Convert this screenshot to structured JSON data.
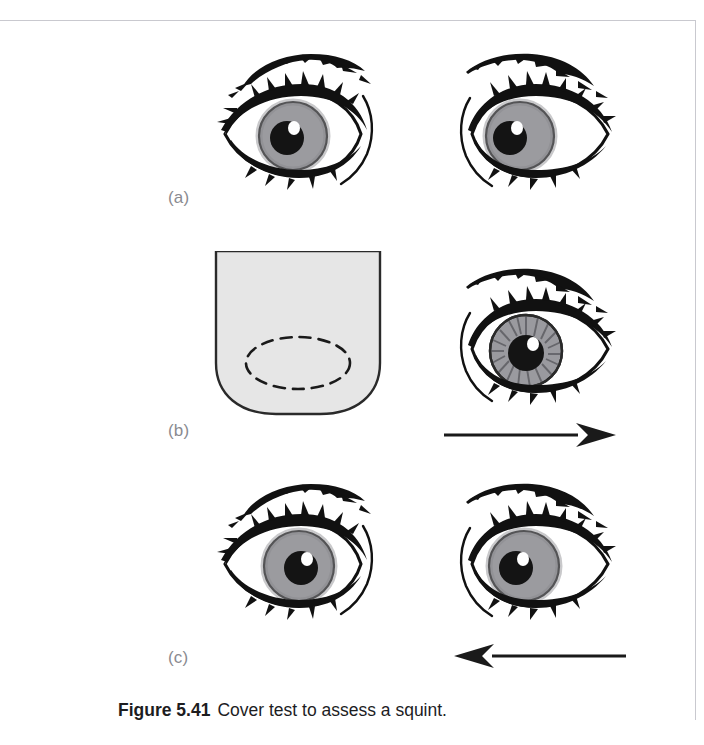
{
  "figure": {
    "caption_number": "Figure 5.41",
    "caption_text": "Cover test to assess a squint.",
    "panels": [
      {
        "id": "a",
        "label": "(a)",
        "left_eye": {
          "kind": "open-eye",
          "iris_style": "plain",
          "pupil_offset_x": -6,
          "pupil_offset_y": 2
        },
        "right_eye": {
          "kind": "open-eye",
          "iris_style": "plain",
          "pupil_offset_x": -14,
          "pupil_offset_y": 4
        },
        "arrow": null
      },
      {
        "id": "b",
        "label": "(b)",
        "left_eye": {
          "kind": "occluder",
          "hidden_eye_outline": "dashed-ellipse"
        },
        "right_eye": {
          "kind": "open-eye",
          "iris_style": "radial",
          "pupil_offset_x": 0,
          "pupil_offset_y": 2
        },
        "arrow": {
          "direction": "right",
          "name": "arrow-right-icon"
        }
      },
      {
        "id": "c",
        "label": "(c)",
        "left_eye": {
          "kind": "open-eye",
          "iris_style": "plain",
          "pupil_offset_x": 4,
          "pupil_offset_y": 2
        },
        "right_eye": {
          "kind": "open-eye",
          "iris_style": "plain",
          "pupil_offset_x": -10,
          "pupil_offset_y": 2
        },
        "arrow": {
          "direction": "left",
          "name": "arrow-left-icon"
        }
      }
    ]
  },
  "colors": {
    "iris": "#9b9b9f",
    "iris_dark": "#87878c",
    "pupil": "#141414",
    "highlight": "#ffffff",
    "ink": "#111111",
    "occluder_fill": "#e6e6e6",
    "occluder_stroke": "#2a2a2a",
    "label_grey": "#8a8a90",
    "rule_grey": "#c9c9cf",
    "caption_ink": "#1d1d1f"
  }
}
